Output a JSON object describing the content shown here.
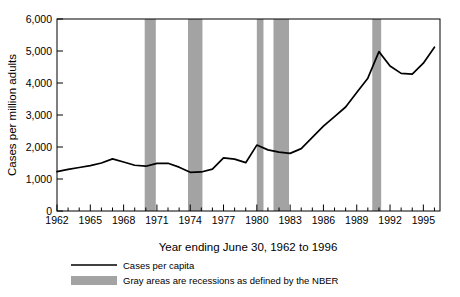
{
  "chart_data": {
    "type": "line",
    "title": "",
    "xlabel": "Year ending June 30, 1962 to 1996",
    "ylabel": "Cases per million adults",
    "xlim": [
      1962,
      1996.5
    ],
    "ylim": [
      0,
      6000
    ],
    "grid": false,
    "legend_position": "bottom-left",
    "ytick_labels": [
      "0",
      "1,000",
      "2,000",
      "3,000",
      "4,000",
      "5,000",
      "6,000"
    ],
    "ytick_values": [
      0,
      1000,
      2000,
      3000,
      4000,
      5000,
      6000
    ],
    "xtick_labels": [
      "1962",
      "1965",
      "1968",
      "1971",
      "1974",
      "1977",
      "1980",
      "1983",
      "1986",
      "1989",
      "1992",
      "1995"
    ],
    "xtick_values": [
      1962,
      1965,
      1968,
      1971,
      1974,
      1977,
      1980,
      1983,
      1986,
      1989,
      1992,
      1995
    ],
    "xtick_minor_values": [
      1963,
      1964,
      1966,
      1967,
      1969,
      1970,
      1972,
      1973,
      1975,
      1976,
      1978,
      1979,
      1981,
      1982,
      1984,
      1985,
      1987,
      1988,
      1990,
      1991,
      1993,
      1994,
      1996
    ],
    "series": [
      {
        "name": "Cases per capita",
        "color": "#000000",
        "x": [
          1962,
          1963,
          1964,
          1965,
          1966,
          1967,
          1968,
          1969,
          1970,
          1971,
          1972,
          1973,
          1974,
          1975,
          1976,
          1977,
          1978,
          1979,
          1980,
          1981,
          1982,
          1983,
          1984,
          1985,
          1986,
          1987,
          1988,
          1989,
          1990,
          1991,
          1992,
          1993,
          1994,
          1995,
          1996
        ],
        "values": [
          1230,
          1300,
          1360,
          1420,
          1500,
          1630,
          1530,
          1430,
          1400,
          1490,
          1490,
          1370,
          1210,
          1220,
          1310,
          1660,
          1620,
          1510,
          2060,
          1910,
          1840,
          1800,
          1950,
          2300,
          2650,
          2950,
          3250,
          3700,
          4150,
          4980,
          4530,
          4300,
          4280,
          4620,
          5120
        ]
      }
    ],
    "recession_bands": [
      {
        "start": 1969.9,
        "end": 1970.9
      },
      {
        "start": 1973.8,
        "end": 1975.1
      },
      {
        "start": 1980.0,
        "end": 1980.6
      },
      {
        "start": 1981.5,
        "end": 1982.9
      },
      {
        "start": 1990.4,
        "end": 1991.2
      }
    ],
    "recession_color": "#a3a3a3"
  },
  "legend": {
    "items": [
      {
        "label": "Cases per capita",
        "marker": "line"
      },
      {
        "label": "Gray areas are recessions as defined by the NBER",
        "marker": "swatch"
      }
    ]
  }
}
